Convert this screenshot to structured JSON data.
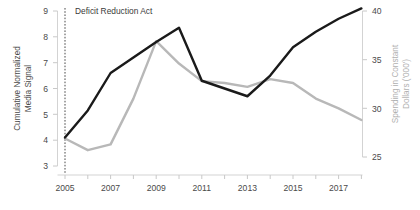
{
  "chart_data": {
    "type": "line",
    "title": "",
    "xlabel": "",
    "x": [
      2005,
      2006,
      2007,
      2008,
      2009,
      2010,
      2011,
      2012,
      2013,
      2014,
      2015,
      2016,
      2017,
      2018
    ],
    "xlim": [
      2005,
      2018
    ],
    "xticks_labeled": [
      "2005",
      "2007",
      "2009",
      "2011",
      "2013",
      "2015",
      "2017"
    ],
    "grid": false,
    "legend": "none",
    "series": [
      {
        "name": "Cumulative Normalized Media Signal",
        "axis": "left",
        "color": "#1a1a1a",
        "values": [
          4.1,
          5.15,
          6.6,
          7.2,
          7.8,
          8.35,
          6.3,
          6.0,
          5.7,
          6.5,
          7.6,
          8.2,
          8.7,
          9.1
        ]
      },
      {
        "name": "Spending in Constant Dollars ('000')",
        "axis": "right",
        "color": "#b8b8b8",
        "values": [
          26.9,
          25.7,
          26.3,
          31.0,
          36.9,
          34.6,
          32.8,
          32.6,
          32.2,
          33.0,
          32.6,
          31.0,
          30.0,
          28.8
        ]
      }
    ],
    "left_axis": {
      "label": "Cumulative Normalized Media Signal",
      "ticks": [
        3,
        4,
        5,
        6,
        7,
        8,
        9
      ],
      "ylim": [
        3,
        9
      ]
    },
    "right_axis": {
      "label": "Spending in Constant Dollars ('000')",
      "ticks": [
        25,
        30,
        35,
        40
      ],
      "ylim": [
        25,
        40
      ]
    },
    "annotations": [
      {
        "text": "Deficit Reduction Act",
        "x": 2005,
        "type": "vertical-dashed-line"
      }
    ]
  },
  "labels": {
    "left_axis_line1": "Cumulative Normalized",
    "left_axis_line2": "Media Signal",
    "right_axis_line1": "Spending in Constant",
    "right_axis_line2": "Dollars ('000')",
    "annotation": "Deficit Reduction Act",
    "ytick_3": "3",
    "ytick_4": "4",
    "ytick_5": "5",
    "ytick_6": "6",
    "ytick_7": "7",
    "ytick_8": "8",
    "ytick_9": "9",
    "rtick_25": "25",
    "rtick_30": "30",
    "rtick_35": "35",
    "rtick_40": "40",
    "xtick_2005": "2005",
    "xtick_2007": "2007",
    "xtick_2009": "2009",
    "xtick_2011": "2011",
    "xtick_2013": "2013",
    "xtick_2015": "2015",
    "xtick_2017": "2017"
  }
}
